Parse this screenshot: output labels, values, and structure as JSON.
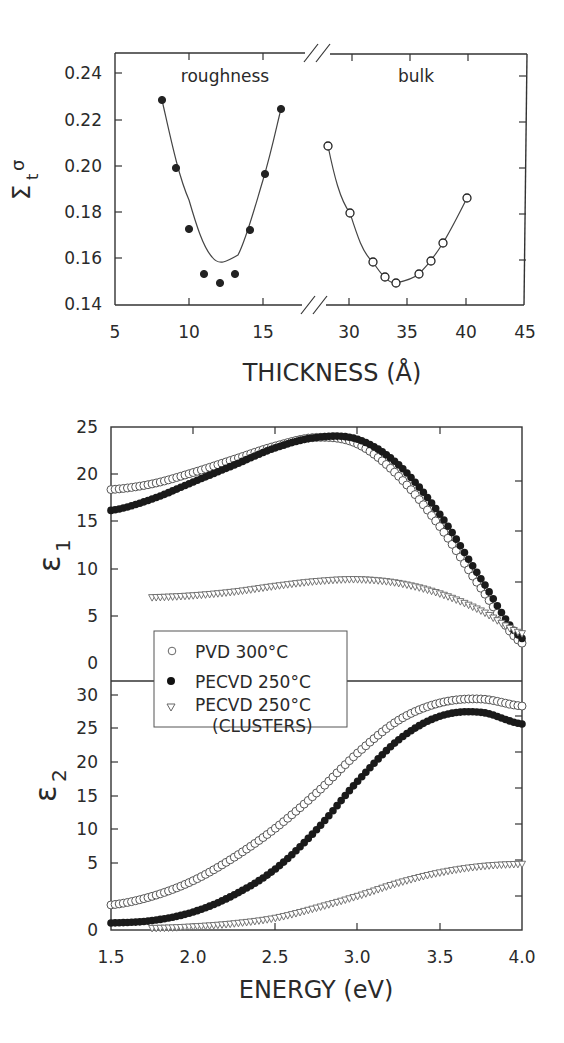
{
  "figure": {
    "top_panel": {
      "ylabel": "Σtσ",
      "ylabel_main": "Σ",
      "ylabel_sub": "t",
      "ylabel_sup": "σ",
      "xlabel": "THICKNESS (Å)",
      "region_labels": [
        "roughness",
        "bulk"
      ],
      "yticks": [
        "0.24",
        "0.22",
        "0.20",
        "0.18",
        "0.16",
        "0.14"
      ],
      "xticks_left": [
        "5",
        "10",
        "15"
      ],
      "xticks_right": [
        "30",
        "35",
        "40",
        "45"
      ]
    },
    "bottom_panel": {
      "ylabel_top": "ε1",
      "ylabel_top_main": "ε",
      "ylabel_top_sub": "1",
      "ylabel_bottom": "ε2",
      "ylabel_bottom_main": "ε",
      "ylabel_bottom_sub": "2",
      "xlabel": "ENERGY (eV)",
      "eps1_yticks": [
        "25",
        "20",
        "15",
        "10",
        "5",
        "0"
      ],
      "eps2_yticks": [
        "30",
        "25",
        "20",
        "15",
        "10",
        "5",
        "0"
      ],
      "xticks": [
        "1.5",
        "2.0",
        "2.5",
        "3.0",
        "3.5",
        "4.0"
      ],
      "legend": [
        {
          "marker": "open-circle",
          "label": "PVD 300°C"
        },
        {
          "marker": "filled-circle",
          "label": "PECVD 250°C"
        },
        {
          "marker": "open-triangle-down",
          "label": "PECVD 250°C",
          "label2": "(CLUSTERS)"
        }
      ]
    }
  },
  "chart_data": [
    {
      "type": "scatter",
      "title": "",
      "xlabel": "THICKNESS (Å)",
      "ylabel": "Σtσ",
      "xlim": [
        5,
        45
      ],
      "ylim": [
        0.14,
        0.25
      ],
      "axis_break": [
        17,
        27
      ],
      "grid": false,
      "annotations": [
        "roughness",
        "bulk"
      ],
      "series": [
        {
          "name": "roughness",
          "marker": "filled-circle",
          "fit_line": true,
          "x": [
            8,
            9,
            10,
            11,
            12,
            13,
            14,
            15,
            16
          ],
          "y": [
            0.229,
            0.2,
            0.173,
            0.153,
            0.15,
            0.153,
            0.172,
            0.197,
            0.225
          ]
        },
        {
          "name": "bulk",
          "marker": "open-circle",
          "fit_line": true,
          "x": [
            28,
            30,
            32,
            33,
            34,
            36,
            37,
            38,
            40
          ],
          "y": [
            0.209,
            0.18,
            0.159,
            0.152,
            0.149,
            0.153,
            0.159,
            0.167,
            0.187
          ]
        }
      ]
    },
    {
      "type": "scatter",
      "title": "",
      "xlabel": "ENERGY (eV)",
      "ylabel": "ε1",
      "xlim": [
        1.5,
        4.0
      ],
      "ylim": [
        0,
        25
      ],
      "grid": false,
      "legend_position": "lower-left",
      "x": [
        1.5,
        1.75,
        2.0,
        2.25,
        2.5,
        2.75,
        3.0,
        3.25,
        3.5,
        3.75,
        4.0
      ],
      "series": [
        {
          "name": "PVD 300°C",
          "marker": "open-circle",
          "values": [
            18.4,
            19.0,
            20.2,
            21.6,
            23.0,
            23.9,
            23.2,
            19.8,
            14.5,
            8.0,
            2.2
          ]
        },
        {
          "name": "PECVD 250°C",
          "marker": "filled-circle",
          "values": [
            16.2,
            17.4,
            19.2,
            21.0,
            22.8,
            23.9,
            23.7,
            21.0,
            15.8,
            9.0,
            2.7
          ]
        },
        {
          "name": "PECVD 250°C (CLUSTERS)",
          "marker": "open-triangle-down",
          "values": [
            null,
            7.0,
            7.2,
            7.6,
            8.2,
            8.7,
            8.9,
            8.5,
            7.4,
            5.6,
            3.2
          ]
        }
      ]
    },
    {
      "type": "scatter",
      "title": "",
      "xlabel": "ENERGY (eV)",
      "ylabel": "ε2",
      "xlim": [
        1.5,
        4.0
      ],
      "ylim": [
        0,
        30
      ],
      "grid": false,
      "x": [
        1.5,
        1.75,
        2.0,
        2.25,
        2.5,
        2.75,
        3.0,
        3.25,
        3.5,
        3.75,
        4.0
      ],
      "series": [
        {
          "name": "PVD 300°C",
          "marker": "open-circle",
          "values": [
            3.2,
            4.3,
            6.3,
            9.3,
            13.0,
            17.5,
            22.6,
            26.8,
            29.0,
            29.5,
            28.6
          ]
        },
        {
          "name": "PECVD 250°C",
          "marker": "filled-circle",
          "values": [
            0.9,
            1.2,
            2.3,
            4.5,
            7.8,
            12.8,
            19.0,
            24.3,
            27.3,
            27.8,
            26.3
          ]
        },
        {
          "name": "PECVD 250°C (CLUSTERS)",
          "marker": "open-triangle-down",
          "values": [
            null,
            0.2,
            0.4,
            0.8,
            1.5,
            2.8,
            4.3,
            6.0,
            7.3,
            8.1,
            8.4
          ]
        }
      ]
    }
  ]
}
